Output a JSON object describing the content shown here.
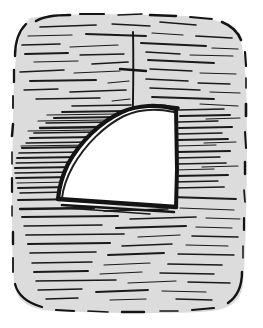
{
  "artwork": {
    "title": "Hand-drawn ink sketch of a sail-like quarter form",
    "medium": "pen and ink hatching",
    "caption": "",
    "canvas": {
      "width": 263,
      "height": 328,
      "background_color": "#ffffff"
    }
  },
  "palette": {
    "paper_white": "#ffffff",
    "panel_gray": "#dcdcdc",
    "panel_gray_light": "#e4e4e4",
    "ink_black": "#141414",
    "ink_soft": "#2a2a2a"
  },
  "panel": {
    "name": "hatched background panel",
    "fill_color": "#dcdcdc",
    "corner_style": "rounded",
    "border_style": "broken dashed ink strokes",
    "bounds": {
      "x": 12,
      "y": 16,
      "width": 236,
      "height": 296
    }
  },
  "shape": {
    "name": "white sail form",
    "description": "quarter-circle sail with curved left edge, slanted straight right edge, flat bottom",
    "fill_color": "#ffffff",
    "outline_color": "#141414",
    "outline_weight": "bold",
    "bounds": {
      "x": 58,
      "y": 104,
      "width": 120,
      "height": 104
    }
  },
  "mast": {
    "name": "vertical mast line",
    "color": "#141414",
    "x": 133,
    "y_top": 32,
    "y_bottom": 122,
    "tick": {
      "name": "cross tick mark",
      "x": 133,
      "y": 70,
      "half_width": 13
    }
  },
  "hatching": {
    "direction": "horizontal",
    "stroke_color": "#1a1a1a",
    "regions": [
      {
        "name": "upper-field",
        "density": "medium"
      },
      {
        "name": "left-dense-fan",
        "density": "high"
      },
      {
        "name": "right-of-sail",
        "density": "high"
      },
      {
        "name": "lower-field",
        "density": "medium"
      },
      {
        "name": "bottom-sparse",
        "density": "low"
      }
    ]
  },
  "labels": {
    "figure_caption": "",
    "annotation": ""
  }
}
